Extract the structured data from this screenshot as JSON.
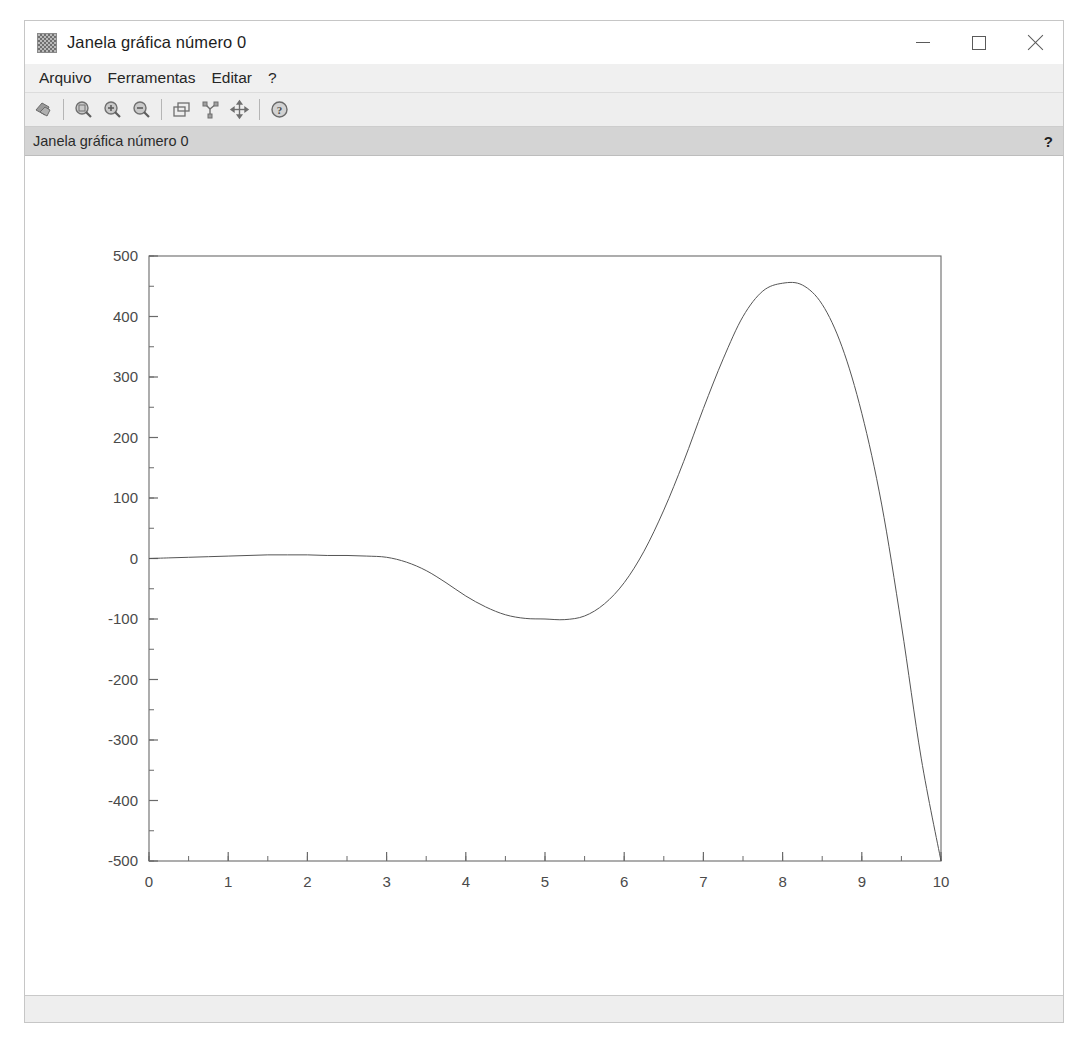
{
  "window": {
    "title": "Janela gráfica número 0",
    "icon": "scilab-graphic-window-icon",
    "buttons": {
      "minimize": "–",
      "maximize": "□",
      "close": "✕"
    }
  },
  "menubar": {
    "items": [
      {
        "label": "Arquivo",
        "name": "menu-arquivo"
      },
      {
        "label": "Ferramentas",
        "name": "menu-ferramentas"
      },
      {
        "label": "Editar",
        "name": "menu-editar"
      },
      {
        "label": "?",
        "name": "menu-help"
      }
    ]
  },
  "toolbar": {
    "items": [
      {
        "icon": "export-file-icon",
        "tooltip": "Exportar"
      },
      {
        "icon": "separator"
      },
      {
        "icon": "zoom-region-icon",
        "tooltip": "Zoom área"
      },
      {
        "icon": "zoom-in-icon",
        "tooltip": "Aumentar zoom"
      },
      {
        "icon": "zoom-out-icon",
        "tooltip": "Diminuir zoom"
      },
      {
        "icon": "separator"
      },
      {
        "icon": "duplicate-window-icon",
        "tooltip": "Duplicar"
      },
      {
        "icon": "rotate-3d-icon",
        "tooltip": "Rotacionar"
      },
      {
        "icon": "pan-move-icon",
        "tooltip": "Mover"
      },
      {
        "icon": "separator"
      },
      {
        "icon": "help-icon",
        "tooltip": "Ajuda"
      }
    ]
  },
  "infobar": {
    "text": "Janela gráfica número 0",
    "help_marker": "?"
  },
  "status_bar": {
    "text": ""
  },
  "chart_data": {
    "type": "line",
    "title": "",
    "xlabel": "",
    "ylabel": "",
    "xlim": [
      0,
      10
    ],
    "ylim": [
      -500,
      500
    ],
    "xticks": [
      0,
      1,
      2,
      3,
      4,
      5,
      6,
      7,
      8,
      9,
      10
    ],
    "xtick_labels": [
      "0",
      "1",
      "2",
      "3",
      "4",
      "5",
      "6",
      "7",
      "8",
      "9",
      "10"
    ],
    "yticks": [
      500,
      400,
      300,
      200,
      100,
      0,
      -100,
      -200,
      -300,
      -400,
      -500
    ],
    "ytick_labels": [
      "500",
      "400",
      "300",
      "200",
      "100",
      "0",
      "-100",
      "-200",
      "-300",
      "-400",
      "-500"
    ],
    "minor_tick_step_x": 0.5,
    "minor_tick_step_y": 50,
    "grid": false,
    "legend": null,
    "line_color": "#555555",
    "line_width": 1,
    "series": [
      {
        "name": "curve",
        "x": [
          0.0,
          0.25,
          0.5,
          0.75,
          1.0,
          1.25,
          1.5,
          1.75,
          2.0,
          2.25,
          2.5,
          2.75,
          3.0,
          3.25,
          3.5,
          3.75,
          4.0,
          4.25,
          4.5,
          4.75,
          5.0,
          5.25,
          5.5,
          5.75,
          6.0,
          6.25,
          6.5,
          6.75,
          7.0,
          7.25,
          7.5,
          7.75,
          8.0,
          8.25,
          8.5,
          8.75,
          9.0,
          9.25,
          9.5,
          9.75,
          10.0
        ],
        "y": [
          0,
          1,
          2,
          3,
          4,
          5,
          6,
          6,
          6,
          5,
          5,
          4,
          2,
          -6,
          -20,
          -40,
          -62,
          -80,
          -93,
          -99,
          -100,
          -101,
          -95,
          -75,
          -40,
          12,
          80,
          160,
          248,
          330,
          400,
          442,
          455,
          452,
          420,
          350,
          240,
          90,
          -110,
          -330,
          -500
        ]
      }
    ],
    "annotations": {
      "peak": {
        "x": 8.2,
        "y": 455
      },
      "trough": {
        "x": 5.2,
        "y": -101
      },
      "zero_crossing": 6.3
    }
  }
}
